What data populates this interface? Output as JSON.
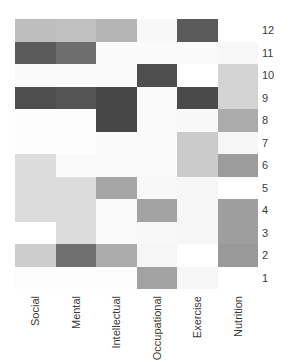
{
  "chart_data": {
    "type": "heatmap",
    "title": "",
    "xlabel": "",
    "ylabel": "",
    "colormap": "grayscale (white = low, dark gray = high)",
    "grid": false,
    "legend": "none",
    "columns": [
      "Social",
      "Mental",
      "Intellectual",
      "Occupational",
      "Exercise",
      "Nutrition"
    ],
    "rows": [
      "12",
      "11",
      "10",
      "9",
      "8",
      "7",
      "6",
      "5",
      "4",
      "3",
      "2",
      "1"
    ],
    "y_axis_position": "right",
    "values": [
      [
        0.3,
        0.29,
        0.35,
        0.02,
        0.8,
        0.0
      ],
      [
        0.8,
        0.7,
        0.02,
        0.02,
        0.02,
        0.03
      ],
      [
        0.02,
        0.02,
        0.02,
        0.85,
        0.0,
        0.2
      ],
      [
        0.85,
        0.82,
        0.88,
        0.02,
        0.87,
        0.2
      ],
      [
        0.01,
        0.01,
        0.88,
        0.02,
        0.03,
        0.4
      ],
      [
        0.01,
        0.01,
        0.02,
        0.02,
        0.25,
        0.04
      ],
      [
        0.16,
        0.02,
        0.02,
        0.02,
        0.25,
        0.48
      ],
      [
        0.16,
        0.16,
        0.42,
        0.03,
        0.04,
        0.0
      ],
      [
        0.16,
        0.16,
        0.02,
        0.45,
        0.04,
        0.47
      ],
      [
        0.0,
        0.16,
        0.02,
        0.03,
        0.04,
        0.47
      ],
      [
        0.23,
        0.7,
        0.4,
        0.04,
        0.0,
        0.5
      ],
      [
        0.01,
        0.01,
        0.01,
        0.45,
        0.04,
        0.0
      ]
    ],
    "colors": [
      [
        "#bebebe",
        "#c0c0c0",
        "#b4b4b4",
        "#f8f8f8",
        "#5a5a5a",
        "#ffffff"
      ],
      [
        "#5a5a5a",
        "#6e6e6e",
        "#fafafa",
        "#fafafa",
        "#fafafa",
        "#f8f8f8"
      ],
      [
        "#fafafa",
        "#fafafa",
        "#fafafa",
        "#4e4e4e",
        "#ffffff",
        "#d4d4d4"
      ],
      [
        "#4e4e4e",
        "#555555",
        "#474747",
        "#fafafa",
        "#4a4a4a",
        "#d4d4d4"
      ],
      [
        "#fdfdfd",
        "#fdfdfd",
        "#474747",
        "#fafafa",
        "#f8f8f8",
        "#ababab"
      ],
      [
        "#fdfdfd",
        "#fdfdfd",
        "#fafafa",
        "#fafafa",
        "#cbcbcb",
        "#f6f6f6"
      ],
      [
        "#dcdcdc",
        "#fafafa",
        "#fafafa",
        "#fafafa",
        "#cbcbcb",
        "#9c9c9c"
      ],
      [
        "#dcdcdc",
        "#dcdcdc",
        "#a6a6a6",
        "#f8f8f8",
        "#f6f6f6",
        "#ffffff"
      ],
      [
        "#dcdcdc",
        "#dcdcdc",
        "#fafafa",
        "#a2a2a2",
        "#f6f6f6",
        "#9e9e9e"
      ],
      [
        "#ffffff",
        "#dcdcdc",
        "#fafafa",
        "#f8f8f8",
        "#f6f6f6",
        "#9e9e9e"
      ],
      [
        "#cdcdcd",
        "#707070",
        "#ababab",
        "#f6f6f6",
        "#ffffff",
        "#999999"
      ],
      [
        "#fcfcfc",
        "#fcfcfc",
        "#fcfcfc",
        "#a2a2a2",
        "#f6f6f6",
        "#ffffff"
      ]
    ]
  }
}
